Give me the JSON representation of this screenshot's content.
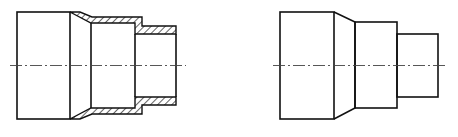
{
  "figure": {
    "left_view": {
      "label": "section-view",
      "hatched": true
    },
    "right_view": {
      "label": "exterior-view",
      "hatched": false
    },
    "colors": {
      "line": "#111111",
      "background": "#ffffff",
      "centerline": "#444444"
    }
  }
}
